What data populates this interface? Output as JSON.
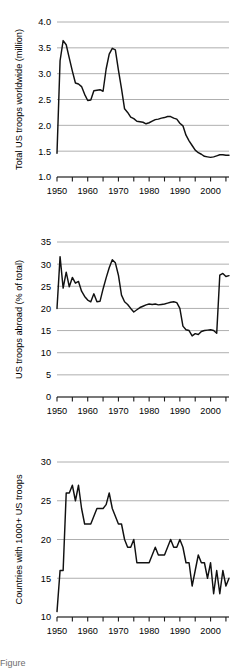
{
  "figure": {
    "width": 241,
    "height": 670,
    "background": "#ffffff",
    "line_color": "#111111",
    "grid_color": "#9a9a9a",
    "axis_color": "#1a1a1a",
    "caption_fragment": "Figure"
  },
  "chart_data": [
    {
      "id": "total-us-troops-worldwide",
      "type": "line",
      "title": "",
      "xlabel": "",
      "ylabel": "Total US troops worldwide (million)",
      "xlim": [
        1950,
        2006
      ],
      "ylim": [
        1.0,
        4.0
      ],
      "yticks": [
        1.0,
        1.5,
        2.0,
        2.5,
        3.0,
        3.5,
        4.0
      ],
      "ytick_labels": [
        "1.0",
        "1.5",
        "2.0",
        "2.5",
        "3.0",
        "3.5",
        "4.0"
      ],
      "xticks": [
        1950,
        1960,
        1970,
        1980,
        1990,
        2000
      ],
      "xtick_labels": [
        "1950",
        "1960",
        "1970",
        "1980",
        "1990",
        "2000"
      ],
      "xminor_step": 5,
      "grid": "horizontal",
      "legend": "none",
      "x": [
        1950,
        1951,
        1952,
        1953,
        1954,
        1955,
        1956,
        1957,
        1958,
        1959,
        1960,
        1961,
        1962,
        1963,
        1964,
        1965,
        1966,
        1967,
        1968,
        1969,
        1970,
        1971,
        1972,
        1973,
        1974,
        1975,
        1976,
        1977,
        1978,
        1979,
        1980,
        1981,
        1982,
        1983,
        1984,
        1985,
        1986,
        1987,
        1988,
        1989,
        1990,
        1991,
        1992,
        1993,
        1994,
        1995,
        1996,
        1997,
        1998,
        1999,
        2000,
        2001,
        2002,
        2003,
        2004,
        2005,
        2006
      ],
      "values": [
        1.46,
        3.25,
        3.64,
        3.56,
        3.3,
        3.05,
        2.82,
        2.8,
        2.75,
        2.6,
        2.48,
        2.49,
        2.67,
        2.68,
        2.69,
        2.66,
        3.09,
        3.38,
        3.49,
        3.46,
        3.07,
        2.71,
        2.32,
        2.25,
        2.16,
        2.13,
        2.08,
        2.07,
        2.06,
        2.03,
        2.05,
        2.08,
        2.11,
        2.12,
        2.14,
        2.15,
        2.17,
        2.17,
        2.14,
        2.12,
        2.04,
        1.99,
        1.81,
        1.7,
        1.61,
        1.52,
        1.47,
        1.44,
        1.4,
        1.39,
        1.38,
        1.39,
        1.41,
        1.43,
        1.43,
        1.42,
        1.42
      ]
    },
    {
      "id": "us-troops-abroad-pct",
      "type": "line",
      "title": "",
      "xlabel": "",
      "ylabel": "US troops abroad (% of total)",
      "xlim": [
        1950,
        2006
      ],
      "ylim": [
        0,
        35
      ],
      "yticks": [
        0,
        5,
        10,
        15,
        20,
        25,
        30,
        35
      ],
      "ytick_labels": [
        "0",
        "5",
        "10",
        "15",
        "20",
        "25",
        "30",
        "35"
      ],
      "xticks": [
        1950,
        1960,
        1970,
        1980,
        1990,
        2000
      ],
      "xtick_labels": [
        "1950",
        "1960",
        "1970",
        "1980",
        "1990",
        "2000"
      ],
      "xminor_step": 5,
      "grid": "horizontal",
      "legend": "none",
      "x": [
        1950,
        1951,
        1952,
        1953,
        1954,
        1955,
        1956,
        1957,
        1958,
        1959,
        1960,
        1961,
        1962,
        1963,
        1964,
        1965,
        1966,
        1967,
        1968,
        1969,
        1970,
        1971,
        1972,
        1973,
        1974,
        1975,
        1976,
        1977,
        1978,
        1979,
        1980,
        1981,
        1982,
        1983,
        1984,
        1985,
        1986,
        1987,
        1988,
        1989,
        1990,
        1991,
        1992,
        1993,
        1994,
        1995,
        1996,
        1997,
        1998,
        1999,
        2000,
        2001,
        2002,
        2003,
        2004,
        2005,
        2006
      ],
      "values": [
        20.0,
        31.7,
        24.6,
        28.2,
        24.9,
        27.0,
        25.7,
        26.1,
        23.9,
        22.7,
        21.9,
        21.5,
        23.3,
        21.5,
        21.6,
        24.4,
        26.9,
        29.2,
        31.0,
        30.3,
        27.5,
        23.0,
        21.5,
        20.9,
        20.0,
        19.2,
        19.7,
        20.2,
        20.5,
        20.8,
        21.0,
        20.9,
        21.0,
        20.8,
        20.9,
        21.0,
        21.2,
        21.4,
        21.5,
        21.3,
        20.0,
        16.0,
        15.2,
        15.0,
        13.8,
        14.3,
        14.1,
        14.8,
        15.0,
        15.1,
        15.2,
        15.0,
        14.4,
        27.5,
        27.9,
        27.2,
        27.4
      ]
    },
    {
      "id": "countries-with-1000-plus-us-troops",
      "type": "line",
      "title": "",
      "xlabel": "",
      "ylabel": "Countries with 1000+ US troops",
      "xlim": [
        1950,
        2006
      ],
      "ylim": [
        10,
        30
      ],
      "yticks": [
        10,
        15,
        20,
        25,
        30
      ],
      "ytick_labels": [
        "10",
        "15",
        "20",
        "25",
        "30"
      ],
      "xticks": [
        1950,
        1960,
        1970,
        1980,
        1990,
        2000
      ],
      "xtick_labels": [
        "1950",
        "1960",
        "1970",
        "1980",
        "1990",
        "2000"
      ],
      "xminor_step": 5,
      "grid": "horizontal",
      "legend": "none",
      "x": [
        1950,
        1951,
        1952,
        1953,
        1954,
        1955,
        1956,
        1957,
        1958,
        1959,
        1960,
        1961,
        1962,
        1963,
        1964,
        1965,
        1966,
        1967,
        1968,
        1969,
        1970,
        1971,
        1972,
        1973,
        1974,
        1975,
        1976,
        1977,
        1978,
        1979,
        1980,
        1981,
        1982,
        1983,
        1984,
        1985,
        1986,
        1987,
        1988,
        1989,
        1990,
        1991,
        1992,
        1993,
        1994,
        1995,
        1996,
        1997,
        1998,
        1999,
        2000,
        2001,
        2002,
        2003,
        2004,
        2005,
        2006
      ],
      "values": [
        10.7,
        16.0,
        16.0,
        26.0,
        26.0,
        27.0,
        25.0,
        27.0,
        24.0,
        22.0,
        22.0,
        22.0,
        23.0,
        24.0,
        24.0,
        24.0,
        24.5,
        26.0,
        24.0,
        23.0,
        22.0,
        22.0,
        20.0,
        19.0,
        19.0,
        20.0,
        17.0,
        17.0,
        17.0,
        17.0,
        17.0,
        18.0,
        19.0,
        18.0,
        18.0,
        18.0,
        19.0,
        20.0,
        19.0,
        19.0,
        20.0,
        19.0,
        17.0,
        17.0,
        14.0,
        16.0,
        18.0,
        17.0,
        17.0,
        15.0,
        17.0,
        13.0,
        16.0,
        13.0,
        16.0,
        14.0,
        15.0
      ]
    }
  ]
}
